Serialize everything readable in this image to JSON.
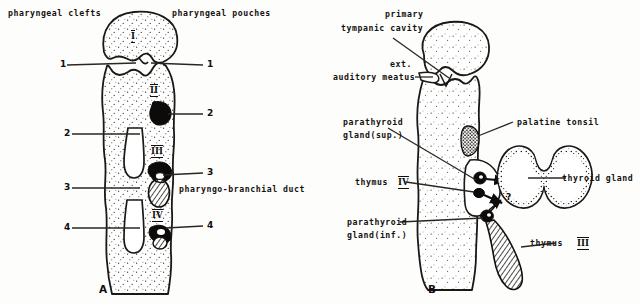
{
  "figure": {
    "title_visible": false,
    "panels": [
      {
        "id": "A",
        "letter": "A"
      },
      {
        "id": "B",
        "letter": "B"
      }
    ]
  },
  "panel_a": {
    "header_left": "pharyngeal clefts",
    "header_right": "pharyngeal pouches",
    "pouch_numerals": [
      "I",
      "II",
      "III",
      "IV"
    ],
    "cleft_labels": [
      "1",
      "2",
      "3",
      "4"
    ],
    "pouch_labels": [
      "1",
      "2",
      "3",
      "4"
    ],
    "duct_label": "pharyngo-branchial duct",
    "letter": "A"
  },
  "panel_b": {
    "labels": {
      "primary_tympanic_cavity": "primary\ntympanic cavity",
      "primary_tympanic_cavity_line1": "primary",
      "primary_tympanic_cavity_line2": "tympanic cavity",
      "ext_auditory_meatus_line1": "ext.",
      "ext_auditory_meatus_line2": "auditory meatus",
      "parathyroid_sup_line1": "parathyroid",
      "parathyroid_sup_line2": "gland(sup.)",
      "parathyroid_inf_line1": "parathyroid",
      "parathyroid_inf_line2": "gland(inf.)",
      "thymus_iv_text": "thymus",
      "thymus_iv_numeral": "IV",
      "thymus_iii_text": "thymus",
      "thymus_iii_numeral": "III",
      "palatine_tonsil": "palatine tonsil",
      "thyroid_gland": "thyroid gland",
      "question_mark": "?"
    },
    "letter": "B"
  },
  "colors": {
    "ink": "#15120f",
    "outline": "#1b1815",
    "paper": "#fdfdfc",
    "fill_dark": "#0d0b09",
    "stipple": "#2b2722"
  }
}
